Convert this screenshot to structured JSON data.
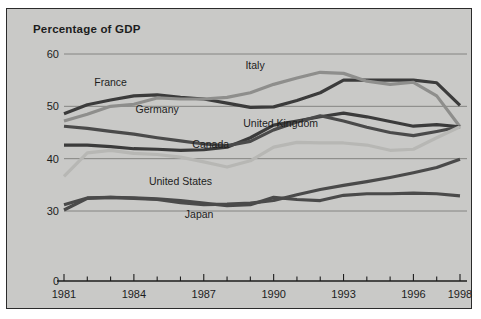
{
  "figure": {
    "title": "Percentage of GDP",
    "background_color": "#c9c9c7",
    "border_color": "#2b2b2b"
  },
  "chart_data": {
    "type": "line",
    "title": "Percentage of GDP",
    "xlabel": "",
    "ylabel": "",
    "grid": true,
    "legend_position": "inline-labels",
    "xlim": [
      1981,
      1998
    ],
    "ylim": [
      0,
      60
    ],
    "y_ticks": [
      0,
      30,
      40,
      50,
      60
    ],
    "y_tick_labels": [
      "0",
      "30",
      "40",
      "50",
      "60"
    ],
    "y_axis_break": true,
    "x_ticks": [
      1981,
      1982,
      1983,
      1984,
      1985,
      1986,
      1987,
      1988,
      1989,
      1990,
      1991,
      1992,
      1993,
      1994,
      1995,
      1996,
      1997,
      1998
    ],
    "x_tick_labels_shown": [
      "1981",
      "1984",
      "1987",
      "1990",
      "1993",
      "1996",
      "1998"
    ],
    "x": [
      1981,
      1982,
      1983,
      1984,
      1985,
      1986,
      1987,
      1988,
      1989,
      1990,
      1991,
      1992,
      1993,
      1994,
      1995,
      1996,
      1997,
      1998
    ],
    "series": [
      {
        "name": "France",
        "color": "#3b3b3b",
        "label_x": 1983.0,
        "label_y": 53.9,
        "values": [
          48.6,
          50.3,
          51.2,
          52.0,
          52.2,
          51.7,
          51.4,
          50.6,
          49.8,
          49.9,
          51.1,
          52.6,
          55.0,
          55.0,
          55.0,
          55.0,
          54.5,
          50.2
        ]
      },
      {
        "name": "Italy",
        "color": "#8e8e8c",
        "label_x": 1989.2,
        "label_y": 57.2,
        "values": [
          47.2,
          48.5,
          50.0,
          50.4,
          51.6,
          51.4,
          51.4,
          51.7,
          52.6,
          54.2,
          55.4,
          56.5,
          56.3,
          54.8,
          54.2,
          54.6,
          52.0,
          46.1
        ]
      },
      {
        "name": "Germany",
        "color": "#3b3b3b",
        "label_x": 1985.0,
        "label_y": 48.8,
        "values": [
          42.6,
          42.6,
          42.3,
          41.9,
          41.8,
          41.6,
          41.7,
          42.2,
          44.0,
          46.4,
          47.2,
          48.0,
          48.7,
          48.0,
          47.1,
          46.2,
          46.5,
          46.1
        ]
      },
      {
        "name": "United Kingdom",
        "color": "#4a4a4a",
        "label_x": 1990.3,
        "label_y": 46.0,
        "values": [
          46.2,
          45.8,
          45.2,
          44.7,
          44.0,
          43.4,
          42.8,
          42.5,
          43.3,
          45.5,
          47.0,
          48.2,
          47.2,
          46.0,
          45.0,
          44.4,
          45.2,
          46.1
        ]
      },
      {
        "name": "Canada",
        "color": "#b7b7b4",
        "label_x": 1987.3,
        "label_y": 42.0,
        "values": [
          36.6,
          41.1,
          41.6,
          41.0,
          40.8,
          40.3,
          39.4,
          38.4,
          39.6,
          42.2,
          43.1,
          43.0,
          43.0,
          42.6,
          41.6,
          41.8,
          44.0,
          46.1
        ]
      },
      {
        "name": "United States",
        "color": "#4a4a4a",
        "label_x": 1986.0,
        "label_y": 35.0,
        "values": [
          30.2,
          32.4,
          32.6,
          32.5,
          32.3,
          32.0,
          31.5,
          31.0,
          31.2,
          32.6,
          32.2,
          32.0,
          33.0,
          33.3,
          33.3,
          33.4,
          33.3,
          32.9
        ]
      },
      {
        "name": "Japan",
        "color": "#4a4a4a",
        "label_x": 1986.8,
        "label_y": 28.7,
        "values": [
          31.2,
          32.5,
          32.6,
          32.4,
          32.2,
          31.6,
          31.2,
          31.3,
          31.5,
          32.0,
          33.1,
          34.1,
          34.9,
          35.6,
          36.4,
          37.3,
          38.3,
          39.9
        ]
      }
    ]
  },
  "axes": {
    "y_labels": [
      "60",
      "50",
      "40",
      "30",
      "0"
    ],
    "x_labels": [
      "1981",
      "1984",
      "1987",
      "1990",
      "1993",
      "1996",
      "1998"
    ]
  }
}
